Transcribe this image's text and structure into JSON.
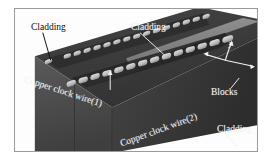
{
  "figure": {
    "kind": "3d-schematic-diagram",
    "background_color": "#ffffff",
    "frame_border_color": "#9a9a9a"
  },
  "palette": {
    "substrate_top": "#3b3b3b",
    "substrate_top_dark": "#2e2e2e",
    "front_face": "#4a4a4a",
    "right_face": "#3a3a3a",
    "block_light": "#c9c9c9",
    "block_shadow": "#8e8e8e",
    "cladding_stripe": "#8d8d8d",
    "wire_dark": "#2a2a2a",
    "leader_line": "#f0f0f0",
    "leader_line_dark": "#1a1a1a",
    "label_dark": "#0d0d0d",
    "label_light": "#f2f2f2"
  },
  "labels": {
    "cladding_top_left": "Cladding",
    "cladding_top_center": "Cladding",
    "cladding_bottom_right": "Cladding",
    "blocks": "Blocks",
    "copper_clock_wire_1": "Copper clock wire(1)",
    "copper_clock_wire_2": "Copper clock wire(2)"
  },
  "axes": {
    "y": "y",
    "x": "x"
  },
  "geometry": {
    "block_rows": [
      {
        "name": "upper-row",
        "count": 18
      },
      {
        "name": "lower-row",
        "count": 14
      }
    ],
    "cladding_stripe_count": 2
  }
}
